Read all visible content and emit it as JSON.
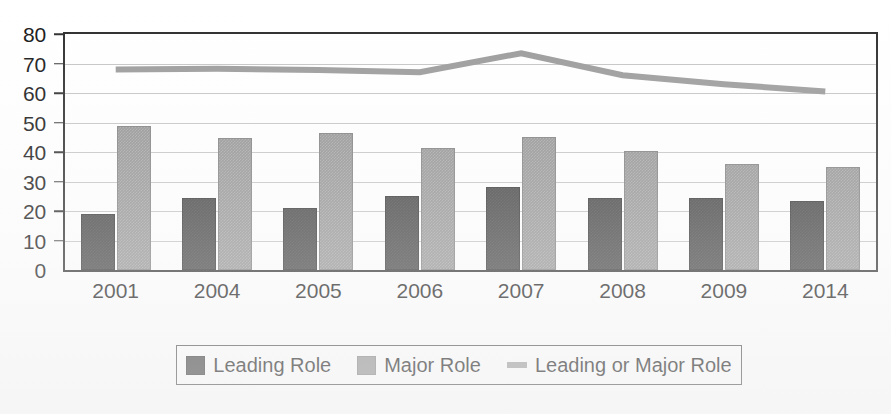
{
  "chart_data": {
    "type": "bar",
    "title": "",
    "subtitle": "",
    "xlabel": "",
    "ylabel": "",
    "categories": [
      "2001",
      "2004",
      "2005",
      "2006",
      "2007",
      "2008",
      "2009",
      "2014"
    ],
    "ylim": [
      0,
      80
    ],
    "y_ticks": [
      0,
      10,
      20,
      30,
      40,
      50,
      60,
      70,
      80
    ],
    "grid": true,
    "legend_position": "bottom",
    "series": [
      {
        "name": "Leading Role",
        "type": "bar",
        "color": "#3b3b3b",
        "values": [
          19,
          24.5,
          21,
          25,
          28,
          24.5,
          24.3,
          23.3
        ]
      },
      {
        "name": "Major Role",
        "type": "bar",
        "color": "#8e8e8e",
        "values": [
          48.7,
          44.8,
          46.5,
          41.3,
          45,
          40.5,
          36,
          35
        ]
      },
      {
        "name": "Leading or Major Role",
        "type": "line",
        "color": "#9a9a9a",
        "values": [
          68,
          68.2,
          67.8,
          67,
          73.5,
          66,
          63,
          60.5
        ]
      }
    ]
  },
  "legend": {
    "items": [
      {
        "label": "Leading Role",
        "marker": "square-swatch-dark"
      },
      {
        "label": "Major Role",
        "marker": "square-swatch-gray"
      },
      {
        "label": "Leading or Major Role",
        "marker": "line-swatch-gray"
      }
    ]
  },
  "colors": {
    "leading_role": "#3b3b3b",
    "major_role": "#8e8e8e",
    "combined_line": "#9a9a9a",
    "axis": "#2b2b2b",
    "gridline": "#c4c4c4",
    "background": "#ffffff"
  }
}
